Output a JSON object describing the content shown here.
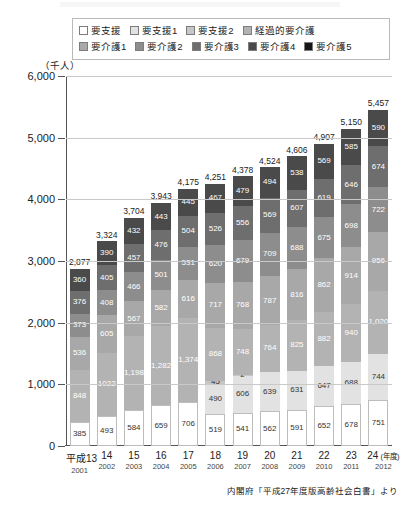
{
  "unit_label": "（千人）",
  "source_note": "内閣府「平成27年度版高齢社会白書」より",
  "legend": {
    "rows": [
      [
        {
          "label": "要支援",
          "color": "#ffffff"
        },
        {
          "label": "要支援1",
          "color": "#e2e2e2"
        },
        {
          "label": "要支援2",
          "color": "#c6c6c6"
        },
        {
          "label": "経過的要介護",
          "color": "#b3b3b3"
        }
      ],
      [
        {
          "label": "要介護1",
          "color": "#a8a8a8"
        },
        {
          "label": "要介護2",
          "color": "#8d8d8d"
        },
        {
          "label": "要介護3",
          "color": "#6e6e6e"
        },
        {
          "label": "要介護4",
          "color": "#4a4a4a"
        },
        {
          "label": "要介護5",
          "color": "#161616"
        }
      ]
    ]
  },
  "chart_data": {
    "type": "bar",
    "subtype": "stacked-vertical",
    "title": "",
    "xlabel": "(年度)",
    "ylabel": "（千人）",
    "ylim": [
      0,
      6000
    ],
    "yticks": [
      0,
      1000,
      2000,
      3000,
      4000,
      5000,
      6000
    ],
    "ytick_labels": [
      "0",
      "1,000",
      "2,000",
      "3,000",
      "4,000",
      "5,000",
      "6,000"
    ],
    "grid": true,
    "legend_position": "top",
    "categories": [
      "平成13",
      "14",
      "15",
      "16",
      "17",
      "18",
      "19",
      "20",
      "21",
      "22",
      "23",
      "24"
    ],
    "categories_western": [
      "2001",
      "2002",
      "2003",
      "2004",
      "2005",
      "2006",
      "2007",
      "2008",
      "2009",
      "2010",
      "2011",
      "2012"
    ],
    "totals": [
      2877,
      3324,
      3704,
      3943,
      4175,
      4251,
      4378,
      4524,
      4606,
      4907,
      5150,
      5457
    ],
    "total_labels": [
      "2,877",
      "3,324",
      "3,704",
      "3,943",
      "4,175",
      "4,251",
      "4,378",
      "4,524",
      "4,606",
      "4,907",
      "5,150",
      "5,457"
    ],
    "series": [
      {
        "name": "要支援",
        "color": "#ffffff",
        "values": [
          385,
          493,
          584,
          659,
          706,
          519,
          541,
          562,
          591,
          652,
          678,
          751
        ],
        "labels": [
          "385",
          "493",
          "584",
          "659",
          "706",
          "519",
          "541",
          "562",
          "591",
          "652",
          "678",
          "751"
        ]
      },
      {
        "name": "要支援1",
        "color": "#e2e2e2",
        "values": [
          0,
          0,
          0,
          0,
          0,
          490,
          606,
          639,
          631,
          647,
          688,
          744
        ],
        "labels": [
          "",
          "",
          "",
          "",
          "",
          "490",
          "606",
          "639",
          "631",
          "647",
          "688",
          "744"
        ]
      },
      {
        "name": "要支援2",
        "color": "#c6c6c6",
        "values": [
          0,
          0,
          0,
          0,
          0,
          45,
          2,
          0,
          0,
          0,
          0,
          0
        ],
        "labels": [
          "",
          "",
          "",
          "",
          "",
          "45",
          "2",
          "",
          "",
          "",
          "",
          ""
        ]
      },
      {
        "name": "経過的要介護",
        "color": "#b3b3b3",
        "values": [
          848,
          1022,
          1198,
          1282,
          1374,
          868,
          748,
          764,
          825,
          882,
          940,
          1020
        ],
        "labels": [
          "848",
          "1022",
          "1,198",
          "1,282",
          "1,374",
          "868",
          "748",
          "764",
          "825",
          "882",
          "940",
          "1,020"
        ]
      },
      {
        "name": "要介護1",
        "color": "#a8a8a8",
        "values": [
          536,
          605,
          567,
          582,
          616,
          717,
          768,
          787,
          816,
          862,
          914,
          956
        ],
        "labels": [
          "536",
          "605",
          "567",
          "582",
          "616",
          "717",
          "768",
          "787",
          "816",
          "862",
          "914",
          "956"
        ]
      },
      {
        "name": "要介護2",
        "color": "#8d8d8d",
        "values": [
          373,
          408,
          466,
          501,
          531,
          620,
          679,
          709,
          688,
          675,
          698,
          722
        ],
        "labels": [
          "373",
          "408",
          "466",
          "501",
          "531",
          "620",
          "679",
          "709",
          "688",
          "675",
          "698",
          "722"
        ]
      },
      {
        "name": "要介護3",
        "color": "#6e6e6e",
        "values": [
          376,
          405,
          457,
          476,
          504,
          526,
          556,
          569,
          607,
          619,
          646,
          674
        ],
        "labels": [
          "376",
          "405",
          "457",
          "476",
          "504",
          "526",
          "556",
          "569",
          "607",
          "619",
          "646",
          "674"
        ]
      },
      {
        "name": "要介護4",
        "color": "#4a4a4a",
        "values": [
          360,
          390,
          432,
          443,
          445,
          467,
          479,
          494,
          538,
          569,
          585,
          590
        ],
        "labels": [
          "360",
          "390",
          "432",
          "443",
          "445",
          "467",
          "479",
          "494",
          "538",
          "569",
          "585",
          "590"
        ]
      },
      {
        "name": "要介護5",
        "color": "#161616",
        "values": [
          0,
          0,
          0,
          0,
          0,
          0,
          0,
          0,
          0,
          0,
          0,
          0
        ],
        "labels": [
          "",
          "",
          "",
          "",
          "",
          "",
          "",
          "",
          "",
          "",
          "",
          ""
        ]
      }
    ]
  }
}
